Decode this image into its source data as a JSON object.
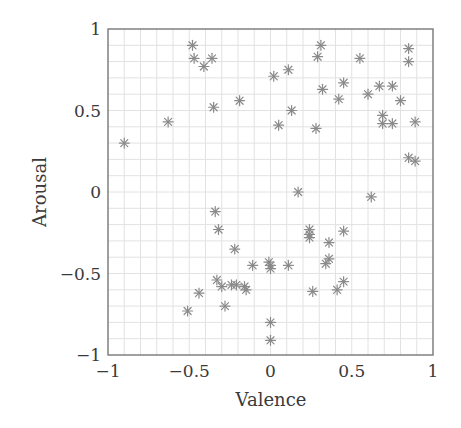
{
  "chart_data": {
    "type": "scatter",
    "title": "",
    "xlabel": "Valence",
    "ylabel": "Arousal",
    "xlim": [
      -1,
      1
    ],
    "ylim": [
      -1,
      1
    ],
    "xticks": [
      "−1",
      "−0.5",
      "0",
      "0.5",
      "1"
    ],
    "yticks": [
      "−1",
      "−0.5",
      "0",
      "0.5",
      "1"
    ],
    "xtick_values": [
      -1,
      -0.5,
      0,
      0.5,
      1
    ],
    "ytick_values": [
      -1,
      -0.5,
      0,
      0.5,
      1
    ],
    "grid": true,
    "minor_grid_step": 0.1,
    "legend": null,
    "marker": "asterisk",
    "marker_color": "#8a8a8a",
    "grid_color": "#e2e2e2",
    "frame_color": "#777777",
    "series": [
      {
        "name": "samples",
        "points": [
          [
            -0.9,
            0.3
          ],
          [
            -0.63,
            0.43
          ],
          [
            -0.48,
            0.9
          ],
          [
            -0.47,
            0.82
          ],
          [
            -0.41,
            0.77
          ],
          [
            -0.36,
            0.82
          ],
          [
            -0.35,
            0.52
          ],
          [
            -0.19,
            0.56
          ],
          [
            0.02,
            0.71
          ],
          [
            0.11,
            0.75
          ],
          [
            0.05,
            0.41
          ],
          [
            0.13,
            0.5
          ],
          [
            0.31,
            0.9
          ],
          [
            0.29,
            0.83
          ],
          [
            0.55,
            0.82
          ],
          [
            0.32,
            0.63
          ],
          [
            0.45,
            0.67
          ],
          [
            0.42,
            0.57
          ],
          [
            0.28,
            0.39
          ],
          [
            0.6,
            0.6
          ],
          [
            0.67,
            0.65
          ],
          [
            0.75,
            0.65
          ],
          [
            0.69,
            0.47
          ],
          [
            0.69,
            0.42
          ],
          [
            0.75,
            0.42
          ],
          [
            0.8,
            0.56
          ],
          [
            0.89,
            0.43
          ],
          [
            0.85,
            0.88
          ],
          [
            0.85,
            0.8
          ],
          [
            0.85,
            0.21
          ],
          [
            0.89,
            0.19
          ],
          [
            0.17,
            0.0
          ],
          [
            0.62,
            -0.03
          ],
          [
            -0.34,
            -0.12
          ],
          [
            -0.32,
            -0.23
          ],
          [
            -0.22,
            -0.35
          ],
          [
            -0.33,
            -0.54
          ],
          [
            -0.3,
            -0.58
          ],
          [
            -0.24,
            -0.57
          ],
          [
            -0.21,
            -0.57
          ],
          [
            -0.16,
            -0.58
          ],
          [
            -0.15,
            -0.6
          ],
          [
            -0.11,
            -0.45
          ],
          [
            -0.44,
            -0.62
          ],
          [
            -0.51,
            -0.73
          ],
          [
            -0.28,
            -0.7
          ],
          [
            -0.01,
            -0.43
          ],
          [
            0.0,
            -0.45
          ],
          [
            0.0,
            -0.47
          ],
          [
            0.11,
            -0.45
          ],
          [
            0.24,
            -0.23
          ],
          [
            0.24,
            -0.26
          ],
          [
            0.24,
            -0.28
          ],
          [
            0.45,
            -0.24
          ],
          [
            0.36,
            -0.31
          ],
          [
            0.36,
            -0.41
          ],
          [
            0.34,
            -0.44
          ],
          [
            0.26,
            -0.61
          ],
          [
            0.45,
            -0.55
          ],
          [
            0.41,
            -0.6
          ],
          [
            0.0,
            -0.8
          ],
          [
            0.0,
            -0.91
          ]
        ]
      }
    ]
  }
}
